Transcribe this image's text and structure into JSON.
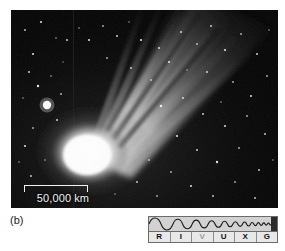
{
  "figure": {
    "panel_letter": "(b)",
    "scale_bar": {
      "label": "50,000 km",
      "icon": "scale-bar-icon"
    }
  },
  "spectrum_bar": {
    "name": "rivuxg-spectrum-indicator",
    "bands": [
      {
        "letter": "R",
        "band": "Radio",
        "active": true
      },
      {
        "letter": "I",
        "band": "Infrared",
        "active": true
      },
      {
        "letter": "V",
        "band": "Visible",
        "active": false
      },
      {
        "letter": "U",
        "band": "Ultraviolet",
        "active": true
      },
      {
        "letter": "X",
        "band": "X-ray",
        "active": true
      },
      {
        "letter": "G",
        "band": "Gamma ray",
        "active": true
      }
    ],
    "wave_fill": "#d2d2d2",
    "wave_stroke": "#1a1a1a",
    "label_fill": "#e8e8e8"
  },
  "photo": {
    "background": "#050505",
    "coma_color": "#ffffff",
    "tail_color": "#cfcfcf",
    "star_color": "#ffffff"
  }
}
